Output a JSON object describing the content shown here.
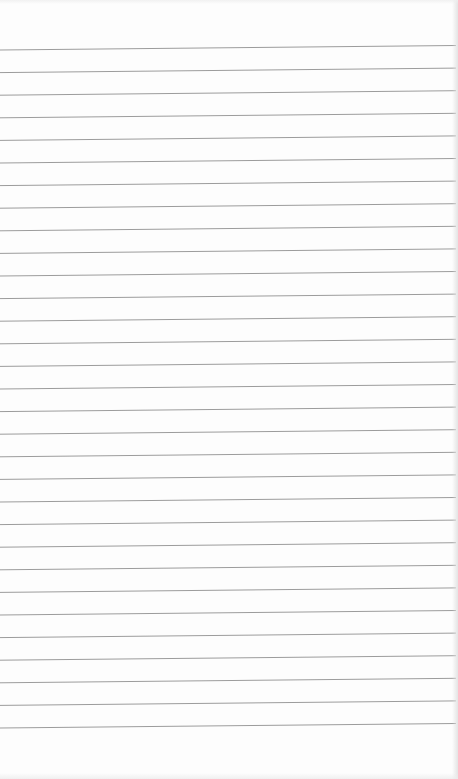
{
  "paper": {
    "type": "lined-paper",
    "background_color": "#fdfdfd",
    "line_color": "#9c9c9c",
    "line_count": 31,
    "first_line_left_y": 50,
    "first_line_right_y": 45.5,
    "line_spacing": 22.6,
    "line_thickness": 1
  }
}
